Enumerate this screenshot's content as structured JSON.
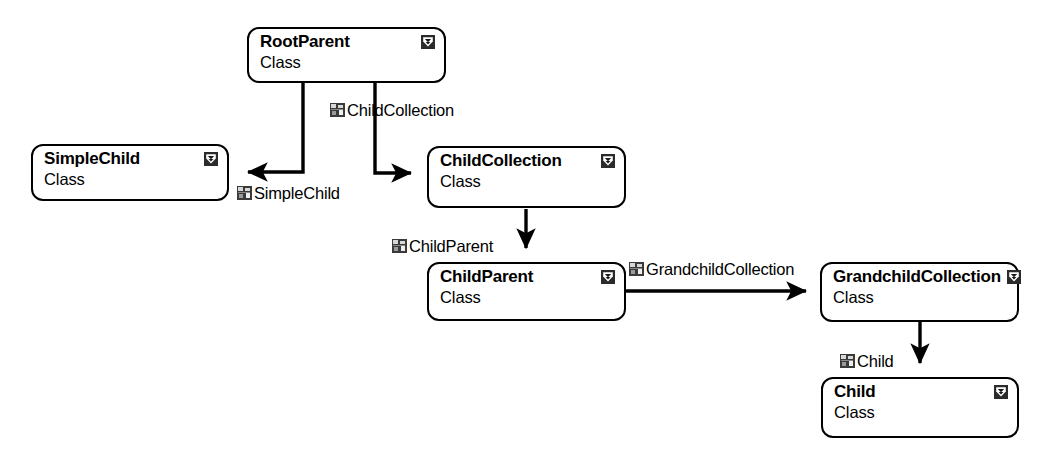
{
  "diagram": {
    "stereotype_label": "Class",
    "classes": [
      {
        "id": "RootParent",
        "name": "RootParent",
        "stereotype": "Class",
        "icon": "class-collapse-icon"
      },
      {
        "id": "SimpleChild",
        "name": "SimpleChild",
        "stereotype": "Class",
        "icon": "class-collapse-icon"
      },
      {
        "id": "ChildCollection",
        "name": "ChildCollection",
        "stereotype": "Class",
        "icon": "class-collapse-icon"
      },
      {
        "id": "ChildParent",
        "name": "ChildParent",
        "stereotype": "Class",
        "icon": "class-collapse-icon"
      },
      {
        "id": "GrandchildCollection",
        "name": "GrandchildCollection",
        "stereotype": "Class",
        "icon": "class-collapse-icon"
      },
      {
        "id": "Child",
        "name": "Child",
        "stereotype": "Class",
        "icon": "class-collapse-icon"
      }
    ],
    "associations": [
      {
        "id": "assoc-simplechild",
        "label": "SimpleChild",
        "from": "RootParent",
        "to": "SimpleChild",
        "icon": "association-property-icon"
      },
      {
        "id": "assoc-childcollection",
        "label": "ChildCollection",
        "from": "RootParent",
        "to": "ChildCollection",
        "icon": "association-property-icon"
      },
      {
        "id": "assoc-childparent",
        "label": "ChildParent",
        "from": "ChildCollection",
        "to": "ChildParent",
        "icon": "association-property-icon"
      },
      {
        "id": "assoc-grandchildcollection",
        "label": "GrandchildCollection",
        "from": "ChildParent",
        "to": "GrandchildCollection",
        "icon": "association-property-icon"
      },
      {
        "id": "assoc-child",
        "label": "Child",
        "from": "GrandchildCollection",
        "to": "Child",
        "icon": "association-property-icon"
      }
    ],
    "colors": {
      "line": "#000000",
      "box_border": "#000000",
      "box_fill": "#ffffff",
      "text": "#000000",
      "icon_fill": "#2b2b2b"
    }
  }
}
